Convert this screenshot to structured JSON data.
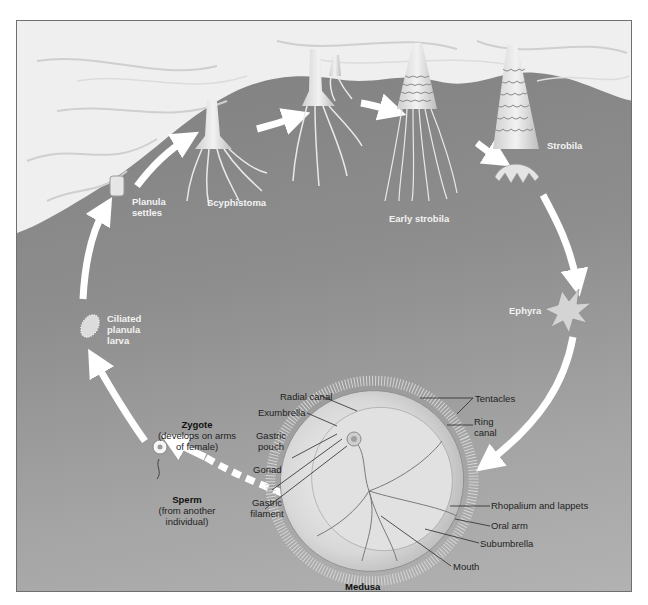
{
  "figure": {
    "background_color": "#8e8e8e",
    "substrate_color": "#f0f0f0",
    "arrow_color": "#ffffff"
  },
  "stages": [
    {
      "id": "planula_settles",
      "label_lines": [
        "Planula",
        "settles"
      ]
    },
    {
      "id": "scyphistoma",
      "label": "Scyphistoma"
    },
    {
      "id": "early_strobila",
      "label": "Early strobila"
    },
    {
      "id": "strobila",
      "label": "Strobila"
    },
    {
      "id": "ephyra",
      "label": "Ephyra"
    },
    {
      "id": "medusa",
      "label": "Medusa"
    },
    {
      "id": "zygote",
      "label": "Zygote",
      "note_lines": [
        "(develops on arms",
        "of female)"
      ]
    },
    {
      "id": "sperm",
      "label": "Sperm",
      "note_lines": [
        "(from another",
        "individual)"
      ]
    },
    {
      "id": "ciliated_planula",
      "label_lines": [
        "Ciliated",
        "planula",
        "larva"
      ]
    }
  ],
  "medusa_parts": {
    "left": [
      {
        "label": "Radial canal"
      },
      {
        "label": "Exumbrella"
      },
      {
        "label_lines": [
          "Gastric",
          "pouch"
        ]
      },
      {
        "label": "Gonad"
      },
      {
        "label_lines": [
          "Gastric",
          "filament"
        ]
      }
    ],
    "right": [
      {
        "label": "Tentacles"
      },
      {
        "label_lines": [
          "Ring",
          "canal"
        ]
      },
      {
        "label": "Rhopalium and lappets"
      },
      {
        "label": "Oral arm"
      },
      {
        "label": "Subumbrella"
      },
      {
        "label": "Mouth"
      }
    ]
  }
}
